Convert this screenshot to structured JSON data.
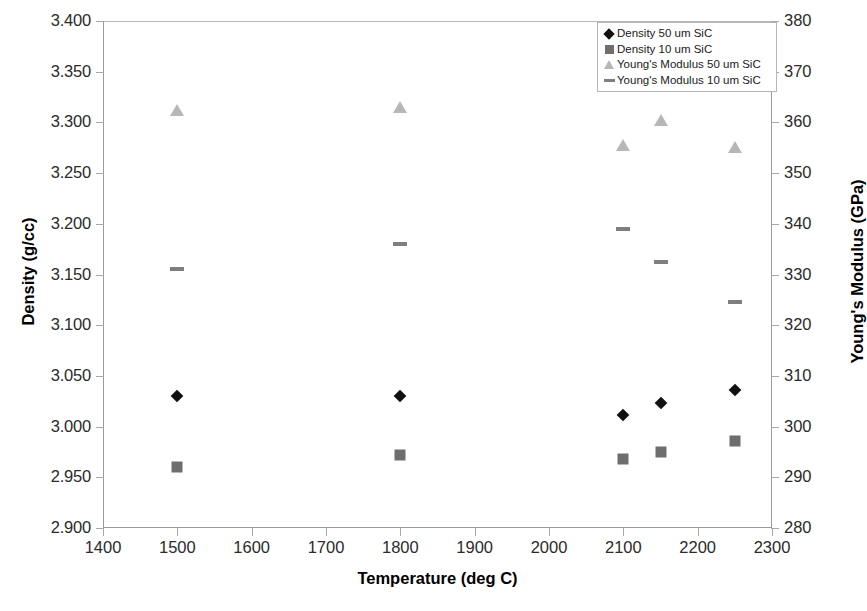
{
  "chart_data": {
    "type": "scatter",
    "title": "",
    "xlabel": "Temperature (deg C)",
    "ylabel": "Density (g/cc)",
    "ylabel_secondary": "Young's Modulus (GPa)",
    "xlim": [
      1400,
      2300
    ],
    "ylim": [
      2.9,
      3.4
    ],
    "ylim_secondary": [
      280,
      380
    ],
    "xticks": [
      1400,
      1500,
      1600,
      1700,
      1800,
      1900,
      2000,
      2100,
      2200,
      2300
    ],
    "xtick_labels": [
      "1400",
      "1500",
      "1600",
      "1700",
      "1800",
      "1900",
      "2000",
      "2100",
      "2200",
      "2300"
    ],
    "yticks": [
      2.9,
      2.95,
      3.0,
      3.05,
      3.1,
      3.15,
      3.2,
      3.25,
      3.3,
      3.35,
      3.4
    ],
    "ytick_labels": [
      "2.900",
      "2.950",
      "3.000",
      "3.050",
      "3.100",
      "3.150",
      "3.200",
      "3.250",
      "3.300",
      "3.350",
      "3.400"
    ],
    "yticks_secondary": [
      280,
      290,
      300,
      310,
      320,
      330,
      340,
      350,
      360,
      370,
      380
    ],
    "ytick_labels_secondary": [
      "280",
      "290",
      "300",
      "310",
      "320",
      "330",
      "340",
      "350",
      "360",
      "370",
      "380"
    ],
    "grid": false,
    "legend_position": "top-right",
    "series": [
      {
        "name": "Density 50 um SiC",
        "marker": "diamond",
        "color": "#111111",
        "axis": "left",
        "x": [
          1500,
          1800,
          2100,
          2150,
          2250
        ],
        "y": [
          3.03,
          3.03,
          3.011,
          3.023,
          3.036
        ]
      },
      {
        "name": "Density 10 um SiC",
        "marker": "square",
        "color": "#6e6e6e",
        "axis": "left",
        "x": [
          1500,
          1800,
          2100,
          2150,
          2250
        ],
        "y": [
          2.96,
          2.972,
          2.968,
          2.975,
          2.986
        ]
      },
      {
        "name": "Young's Modulus 50 um SiC",
        "marker": "triangle",
        "color": "#b7b7b7",
        "axis": "right",
        "x": [
          1500,
          1800,
          2100,
          2150,
          2250
        ],
        "y": [
          362.5,
          363.0,
          355.5,
          360.5,
          355.2
        ]
      },
      {
        "name": "Young's Modulus 10 um SiC",
        "marker": "dash",
        "color": "#7e7e7e",
        "axis": "right",
        "x": [
          1500,
          1800,
          2100,
          2150,
          2250
        ],
        "y": [
          331.0,
          336.0,
          339.0,
          332.5,
          324.5
        ]
      }
    ]
  },
  "legend": {
    "items": [
      {
        "label": "Density 50 um SiC",
        "key": "diamond-marker-icon"
      },
      {
        "label": "Density 10 um SiC",
        "key": "square-marker-icon"
      },
      {
        "label": "Young's Modulus 50 um SiC",
        "key": "triangle-marker-icon"
      },
      {
        "label": "Young's Modulus 10 um SiC",
        "key": "dash-marker-icon"
      }
    ]
  }
}
